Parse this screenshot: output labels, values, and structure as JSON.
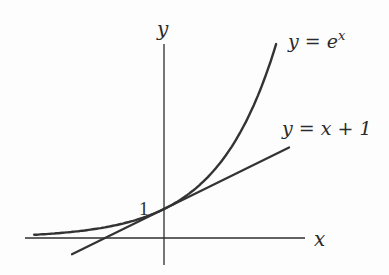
{
  "chart_data": {
    "type": "line",
    "title": "",
    "xlabel": "x",
    "ylabel": "y",
    "grid": false,
    "legend": "inline labels",
    "xlim": [
      -2.35,
      2.4
    ],
    "ylim": [
      -0.95,
      6.8
    ],
    "annotations": [
      {
        "text": "1",
        "x": 0,
        "y": 1,
        "note": "y-intercept label"
      }
    ],
    "series": [
      {
        "name": "y = e^x",
        "label_text": "y = e",
        "label_sup": "x",
        "function": "exp(x)",
        "x": [
          -2.2,
          -1.5,
          -1.0,
          -0.5,
          0,
          0.5,
          1.0,
          1.5,
          1.9
        ],
        "values": [
          0.111,
          0.223,
          0.368,
          0.607,
          1.0,
          1.649,
          2.718,
          4.482,
          6.686
        ]
      },
      {
        "name": "y = x + 1",
        "label_text": "y = x + 1",
        "function": "x+1",
        "x": [
          -1.56,
          2.12
        ],
        "values": [
          -0.56,
          3.12
        ]
      }
    ]
  },
  "labels": {
    "y_axis": "y",
    "x_axis": "x",
    "intercept": "1",
    "exp_curve": "y = e",
    "exp_sup": "x",
    "tangent_line": "y = x + 1"
  }
}
